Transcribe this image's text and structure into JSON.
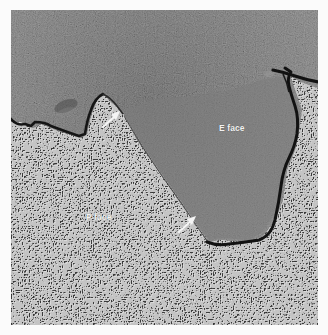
{
  "figure": {
    "type": "freeze-fracture electron micrograph",
    "labels": {
      "e_face": "E face",
      "p_face": "P face"
    },
    "arrows": [
      {
        "name": "upper-arrow",
        "points_to": "fracture step edge (upper)"
      },
      {
        "name": "lower-arrow",
        "points_to": "fracture step edge (lower)"
      }
    ],
    "colors": {
      "background": "#fbfbfb",
      "e_face_tone": "#7a7a7a",
      "p_face_tone": "#666666",
      "crack": "#111111",
      "arrow": "#f5f5f5",
      "label_text": "#f2f2f2"
    }
  }
}
